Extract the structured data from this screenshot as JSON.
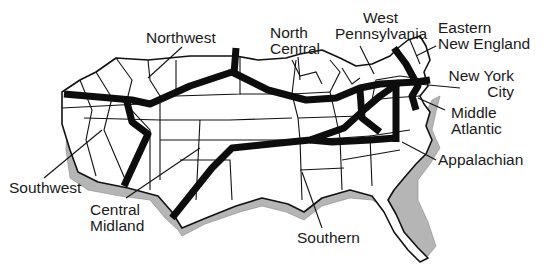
{
  "diagram": {
    "type": "map",
    "colors": {
      "land": "#ffffff",
      "border": "#111111",
      "shadow": "#b5b5b5",
      "route": "#0d0d0d"
    },
    "regions": [
      {
        "id": "northwest",
        "lines": [
          "Northwest"
        ]
      },
      {
        "id": "north-central",
        "lines": [
          "North",
          "Central"
        ]
      },
      {
        "id": "west-pennsylvania",
        "lines": [
          "West",
          "Pennsylvania"
        ]
      },
      {
        "id": "eastern-new-england",
        "lines": [
          "Eastern",
          "New England"
        ]
      },
      {
        "id": "new-york-city",
        "lines": [
          "New York",
          "City"
        ]
      },
      {
        "id": "middle-atlantic",
        "lines": [
          "Middle",
          "Atlantic"
        ]
      },
      {
        "id": "appalachian",
        "lines": [
          "Appalachian"
        ]
      },
      {
        "id": "southwest",
        "lines": [
          "Southwest"
        ]
      },
      {
        "id": "central-midland",
        "lines": [
          "Central",
          "Midland"
        ]
      },
      {
        "id": "southern",
        "lines": [
          "Southern"
        ]
      }
    ]
  }
}
